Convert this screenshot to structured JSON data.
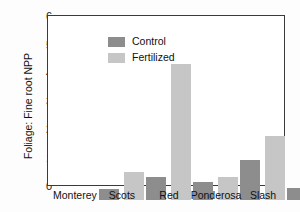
{
  "chart_data": {
    "type": "bar",
    "title": "",
    "xlabel": "",
    "ylabel": "Foliage: Fine root NPP",
    "categories": [
      "Monterey",
      "Scots",
      "Red",
      "Ponderosa",
      "Slash"
    ],
    "series": [
      {
        "name": "Control",
        "color": "#8d8d8d",
        "values": [
          0.4,
          0.8,
          0.62,
          1.4,
          0.42
        ]
      },
      {
        "name": "Fertilized",
        "color": "#c6c6c6",
        "values": [
          1.0,
          4.8,
          0.82,
          2.27,
          1.58
        ]
      }
    ],
    "ylim": [
      0,
      6
    ],
    "yticks": [
      0,
      1,
      2,
      3,
      4,
      5,
      6
    ],
    "ytick_labels": [
      "0",
      "1",
      "2",
      "3",
      "4",
      "5",
      "6"
    ],
    "grid": false,
    "legend_position": "top-left"
  }
}
